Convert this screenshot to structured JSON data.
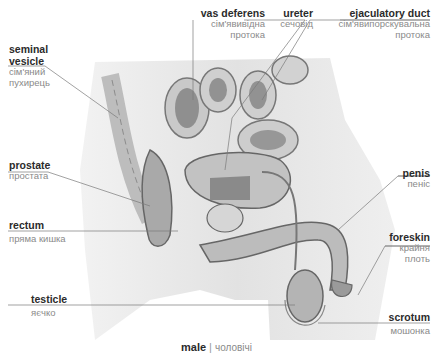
{
  "title": {
    "en": "male",
    "separator": "|",
    "ua": "чоловічі"
  },
  "labels": {
    "seminal_vesicle": {
      "en_line1": "seminal",
      "en_line2": "vesicle",
      "ua_line1": "сім'яний",
      "ua_line2": "пухирець"
    },
    "vas_deferens": {
      "en": "vas deferens",
      "ua_line1": "сім'явивідна",
      "ua_line2": "протока"
    },
    "ureter": {
      "en": "ureter",
      "ua": "сечовід"
    },
    "ejaculatory_duct": {
      "en": "ejaculatory duct",
      "ua_line1": "сім'явипорскувальна",
      "ua_line2": "протока"
    },
    "prostate": {
      "en": "prostate",
      "ua": "простата"
    },
    "penis": {
      "en": "penis",
      "ua": "пеніс"
    },
    "rectum": {
      "en": "rectum",
      "ua": "пряма кишка"
    },
    "foreskin": {
      "en": "foreskin",
      "ua_line1": "крайня",
      "ua_line2": "плоть"
    },
    "testicle": {
      "en": "testicle",
      "ua": "яєчко"
    },
    "scrotum": {
      "en": "scrotum",
      "ua": "мошонка"
    }
  },
  "colors": {
    "label_en": "#2b2b2b",
    "label_ua": "#8a8a8a",
    "leader_line": "#7a7a7a",
    "illustration_bg": "#e6e6e6"
  }
}
